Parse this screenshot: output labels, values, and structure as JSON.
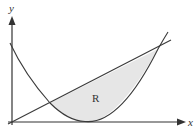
{
  "diagram": {
    "type": "region-between-curves",
    "axes": {
      "x_label": "x",
      "y_label": "y"
    },
    "curves": [
      {
        "name": "parabola",
        "description": "upward-opening parabola, vertex near x-axis"
      },
      {
        "name": "line",
        "description": "straight line through origin with positive slope"
      }
    ],
    "region": {
      "label": "R",
      "description": "region bounded above by the line and below by the parabola, between their two intersection points",
      "fill": "#e6e6e6"
    },
    "colors": {
      "axis": "#333333",
      "curve": "#3a3a3a",
      "region_fill": "#e6e6e6",
      "background": "#ffffff"
    }
  }
}
